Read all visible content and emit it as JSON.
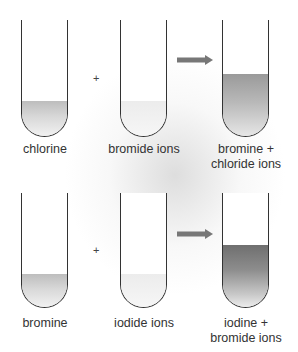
{
  "diagram": {
    "type": "halogen displacement reactions",
    "reactions": [
      {
        "reactant_1": {
          "label": "chlorine",
          "liquid": "light"
        },
        "operator": "+",
        "reactant_2": {
          "label": "bromide ions",
          "liquid": "faint"
        },
        "arrow": "yields-arrow",
        "product": {
          "label_line1": "bromine +",
          "label_line2": "chloride ions",
          "liquid": "medium"
        }
      },
      {
        "reactant_1": {
          "label": "bromine",
          "liquid": "light"
        },
        "operator": "+",
        "reactant_2": {
          "label": "iodide ions",
          "liquid": "faint"
        },
        "arrow": "yields-arrow",
        "product": {
          "label_line1": "iodine +",
          "label_line2": "bromide ions",
          "liquid": "dark"
        }
      }
    ]
  },
  "colors": {
    "arrow": "#777777",
    "outline": "#333333",
    "text": "#333333"
  }
}
